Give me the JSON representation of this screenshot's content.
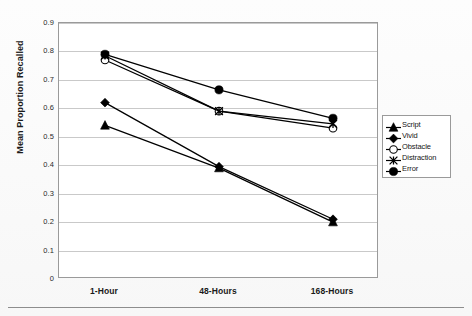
{
  "chart_data": {
    "type": "line",
    "title": "",
    "xlabel": "",
    "ylabel": "Mean Proportion Recalled",
    "categories": [
      "1-Hour",
      "48-Hours",
      "168-Hours"
    ],
    "ylim": [
      0,
      0.9
    ],
    "ytick_step": 0.1,
    "yticks": [
      "0.9",
      "0.8",
      "0.7",
      "0.6",
      "0.5",
      "0.4",
      "0.3",
      "0.2",
      "0.1",
      "0"
    ],
    "ytick_values": [
      0.9,
      0.8,
      0.7,
      0.6,
      0.5,
      0.4,
      0.3,
      0.2,
      0.1,
      0
    ],
    "grid": true,
    "grid_axis": "y",
    "legend_position": "right",
    "series": [
      {
        "name": "Script",
        "marker": "triangle-filled",
        "color": "#000000",
        "values": [
          0.54,
          0.39,
          0.2
        ]
      },
      {
        "name": "Vivid",
        "marker": "diamond-filled",
        "color": "#000000",
        "values": [
          0.62,
          0.395,
          0.21
        ]
      },
      {
        "name": "Obstacle",
        "marker": "circle-open",
        "color": "#000000",
        "values": [
          0.77,
          0.59,
          0.53
        ]
      },
      {
        "name": "Distraction",
        "marker": "x-cross",
        "color": "#000000",
        "values": [
          0.785,
          0.59,
          0.545
        ]
      },
      {
        "name": "Error",
        "marker": "circle-filled",
        "color": "#000000",
        "values": [
          0.79,
          0.665,
          0.565
        ]
      }
    ]
  },
  "legend": {
    "items": [
      {
        "label": "Script"
      },
      {
        "label": "Vivid"
      },
      {
        "label": "Obstacle"
      },
      {
        "label": "Distraction"
      },
      {
        "label": "Error"
      }
    ]
  },
  "axes": {
    "y_title": "Mean Proportion Recalled"
  }
}
